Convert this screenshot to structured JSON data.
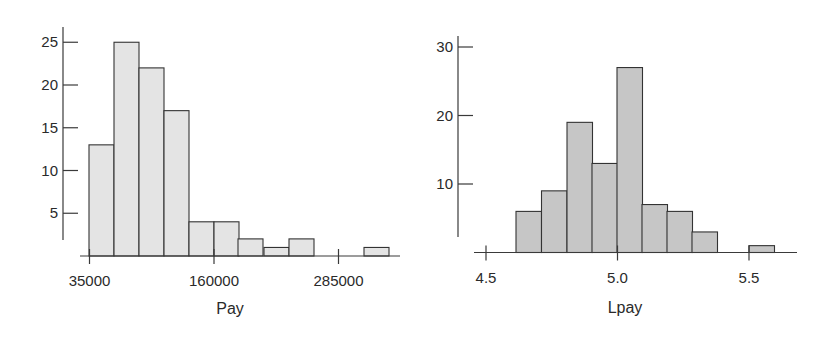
{
  "chart_data": [
    {
      "type": "bar",
      "title": "",
      "xlabel": "Pay",
      "ylabel": "",
      "bin_width": 25000,
      "bin_start": 35000,
      "categories": [
        "35000-60000",
        "60000-85000",
        "85000-110000",
        "110000-135000",
        "135000-160000",
        "160000-185000",
        "185000-210000",
        "210000-235000",
        "235000-260000",
        "260000-285000",
        "285000-310000",
        "310000-335000"
      ],
      "values": [
        13,
        25,
        22,
        17,
        4,
        4,
        2,
        1,
        2,
        0,
        0,
        1
      ],
      "x_ticks": [
        35000,
        160000,
        285000
      ],
      "x_tick_labels": [
        "35000",
        "160000",
        "285000"
      ],
      "y_ticks": [
        5,
        10,
        15,
        20,
        25
      ],
      "y_tick_labels": [
        "5",
        "10",
        "15",
        "20",
        "25"
      ],
      "ylim": [
        0,
        27
      ],
      "grid": false,
      "bar_color": "#e4e4e4"
    },
    {
      "type": "bar",
      "title": "",
      "xlabel": "Lpay",
      "ylabel": "",
      "bin_width": 0.095,
      "bin_start": 4.617,
      "categories": [
        "4.62-4.71",
        "4.71-4.81",
        "4.81-4.90",
        "4.90-5.00",
        "5.00-5.09",
        "5.09-5.19",
        "5.19-5.28",
        "5.28-5.38",
        "5.38-5.47",
        "5.47-5.50",
        "5.50-5.60"
      ],
      "values": [
        6,
        9,
        19,
        13,
        27,
        7,
        6,
        3,
        0,
        0,
        1
      ],
      "x_ticks": [
        4.5,
        5.0,
        5.5
      ],
      "x_tick_labels": [
        "4.5",
        "5.0",
        "5.5"
      ],
      "y_ticks": [
        10,
        20,
        30
      ],
      "y_tick_labels": [
        "10",
        "20",
        "30"
      ],
      "ylim": [
        0,
        32
      ],
      "grid": false,
      "bar_color": "#c6c6c6"
    }
  ],
  "layout": {
    "left": {
      "y_axis_x": 63,
      "y_axis_top": 27,
      "y_axis_bottom": 240,
      "baseline_y": 256,
      "px_per_unit": 8.55,
      "x_axis_from": 80,
      "x_axis_to": 400,
      "x0_value": 35000,
      "x0_px": 89.5,
      "px_per_x": 0.000996,
      "tick_len": 15,
      "bars_x": [
        89,
        114,
        139,
        164,
        189,
        214,
        238,
        264,
        289,
        314,
        339,
        364
      ],
      "bar_w": 25,
      "xlabel_x": 230,
      "xlabel_y": 314
    },
    "right": {
      "y_axis_x": 458,
      "y_axis_top": 36,
      "y_axis_bottom": 237,
      "baseline_y": 252.5,
      "px_per_unit": 6.85,
      "x_axis_from": 474,
      "x_axis_to": 797,
      "x0_value": 4.5,
      "x0_px": 486,
      "px_per_x": 263,
      "tick_len": 15,
      "bars_x": [
        516,
        541.5,
        567,
        592,
        617,
        642,
        667,
        692,
        718,
        743,
        749
      ],
      "bar_w": 25.5,
      "xlabel_x": 625,
      "xlabel_y": 313
    }
  }
}
